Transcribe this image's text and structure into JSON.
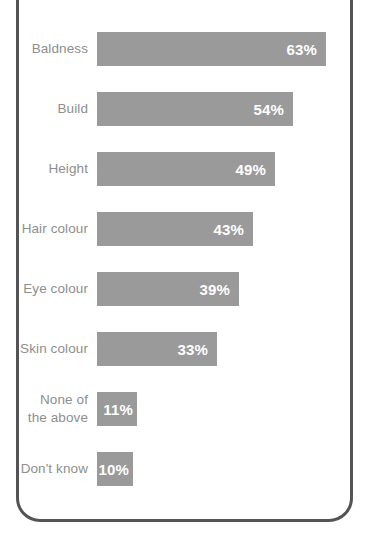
{
  "chart_data": {
    "type": "bar",
    "orientation": "horizontal",
    "title": "",
    "xlabel": "",
    "ylabel": "",
    "categories": [
      "Baldness",
      "Build",
      "Height",
      "Hair colour",
      "Eye colour",
      "Skin colour",
      "None of the above",
      "Don't know"
    ],
    "values": [
      63,
      54,
      49,
      43,
      39,
      33,
      11,
      10
    ],
    "value_labels": [
      "63%",
      "54%",
      "49%",
      "43%",
      "39%",
      "33%",
      "11%",
      "10%"
    ],
    "value_suffix": "%",
    "axis_visible": false,
    "grid": false,
    "legend": "none",
    "xlim": [
      0,
      68
    ]
  },
  "colors": {
    "bar_fill": "#9a9a9a",
    "category_label_text": "#8e8e8e",
    "value_label_text": "#ffffff",
    "frame_border": "#545456",
    "background": "#ffffff"
  }
}
